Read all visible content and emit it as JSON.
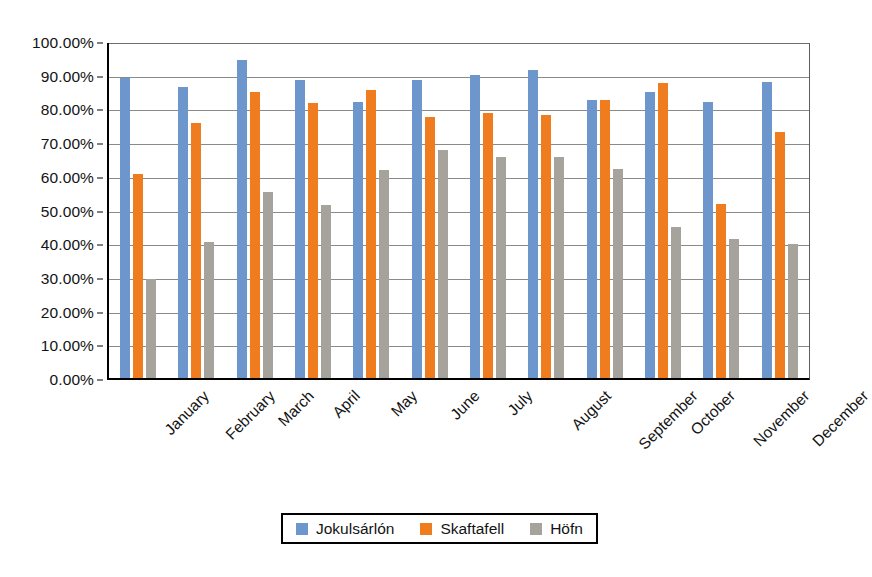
{
  "chart_data": {
    "type": "bar",
    "title": "",
    "subtitle": "",
    "xlabel": "",
    "ylabel": "",
    "ylim": [
      0,
      100
    ],
    "y_tick_labels": [
      "100.00%",
      "90.00%",
      "80.00%",
      "70.00%",
      "60.00%",
      "50.00%",
      "40.00%",
      "30.00%",
      "20.00%",
      "10.00%",
      "0.00%"
    ],
    "y_tick_values": [
      100,
      90,
      80,
      70,
      60,
      50,
      40,
      30,
      20,
      10,
      0
    ],
    "grid": true,
    "legend_position": "bottom",
    "categories": [
      "January",
      "February",
      "March",
      "April",
      "May",
      "June",
      "July",
      "August",
      "September",
      "October",
      "November",
      "December"
    ],
    "series": [
      {
        "name": "Jokulsárlón",
        "color": "#6D96CD",
        "values": [
          89.5,
          87.0,
          95.0,
          89.0,
          82.5,
          89.0,
          90.5,
          92.0,
          83.0,
          85.5,
          82.5,
          88.5
        ]
      },
      {
        "name": "Skaftafell",
        "color": "#EF7C1F",
        "values": [
          60.8,
          76.0,
          85.5,
          82.0,
          86.0,
          78.0,
          79.0,
          78.5,
          83.0,
          88.0,
          52.0,
          73.5
        ]
      },
      {
        "name": "Höfn",
        "color": "#A6A39D",
        "values": [
          29.5,
          40.5,
          55.5,
          51.5,
          62.0,
          68.0,
          66.0,
          66.0,
          62.5,
          45.0,
          41.5,
          40.0
        ]
      }
    ]
  },
  "legend": {
    "items": [
      {
        "label": "Jokulsárlón",
        "color": "#6D96CD",
        "swatch_name": "legend-swatch-jokulsarlon"
      },
      {
        "label": "Skaftafell",
        "color": "#EF7C1F",
        "swatch_name": "legend-swatch-skaftafell"
      },
      {
        "label": "Höfn",
        "color": "#A6A39D",
        "swatch_name": "legend-swatch-hofn"
      }
    ]
  },
  "colors": {
    "series_blue": "#6D96CD",
    "series_orange": "#EF7C1F",
    "series_gray": "#A6A39D",
    "axis": "#000000",
    "gridline": "#8A8A8A",
    "background": "#FFFFFF",
    "text": "#131313"
  }
}
